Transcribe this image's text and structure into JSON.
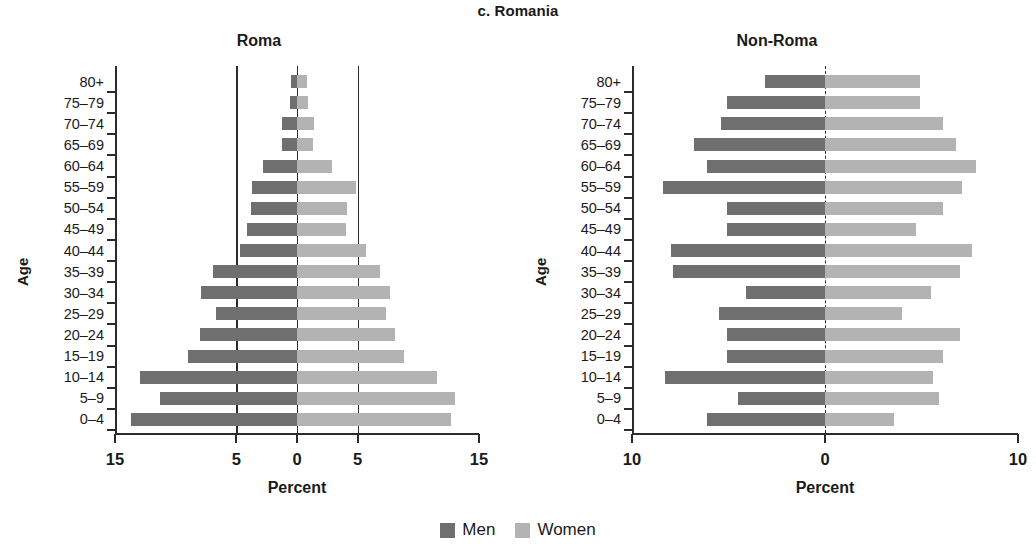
{
  "figure": {
    "title": "c. Romania",
    "legend": [
      {
        "label": "Men",
        "color": "#6f6f6f",
        "key": "men"
      },
      {
        "label": "Women",
        "color": "#b3b3b3",
        "key": "women"
      }
    ]
  },
  "panels": [
    {
      "id": "roma",
      "title": "Roma",
      "xlabel": "Percent",
      "ylabel": "Age"
    },
    {
      "id": "non-roma",
      "title": "Non-Roma",
      "xlabel": "Percent",
      "ylabel": "Age"
    }
  ],
  "chart_data": [
    {
      "type": "bar",
      "subtype": "population-pyramid",
      "title": "Roma",
      "figure_title": "c. Romania",
      "xlabel": "Percent",
      "ylabel": "Age",
      "xlim": [
        -15,
        15
      ],
      "xticks": [
        -15,
        -5,
        0,
        5,
        15
      ],
      "xticklabels": [
        "15",
        "5",
        "0",
        "5",
        "15"
      ],
      "gridlines_vertical": [
        -5,
        0,
        5
      ],
      "grid": false,
      "legend_position": "bottom-center",
      "categories": [
        "80+",
        "75–79",
        "70–74",
        "65–69",
        "60–64",
        "55–59",
        "50–54",
        "45–49",
        "40–44",
        "35–39",
        "30–34",
        "25–29",
        "20–24",
        "15–19",
        "10–14",
        "5–9",
        "0–4"
      ],
      "series": [
        {
          "name": "Men",
          "color": "#6f6f6f",
          "values": [
            0.5,
            0.6,
            1.2,
            1.2,
            2.8,
            3.7,
            3.8,
            4.1,
            4.7,
            6.9,
            7.9,
            6.7,
            8.0,
            9.0,
            12.9,
            11.3,
            13.7
          ]
        },
        {
          "name": "Women",
          "color": "#b3b3b3",
          "values": [
            0.8,
            0.9,
            1.4,
            1.3,
            2.9,
            4.9,
            4.1,
            4.0,
            5.7,
            6.8,
            7.7,
            7.3,
            8.1,
            8.8,
            11.5,
            13.0,
            12.7
          ]
        }
      ]
    },
    {
      "type": "bar",
      "subtype": "population-pyramid",
      "title": "Non-Roma",
      "figure_title": "c. Romania",
      "xlabel": "Percent",
      "ylabel": "Age",
      "xlim": [
        -10,
        10
      ],
      "xticks": [
        -10,
        0,
        10
      ],
      "xticklabels": [
        "10",
        "0",
        "10"
      ],
      "gridlines_vertical": [
        0
      ],
      "grid": false,
      "legend_position": "bottom-center",
      "categories": [
        "80+",
        "75–79",
        "70–74",
        "65–69",
        "60–64",
        "55–59",
        "50–54",
        "45–49",
        "40–44",
        "35–39",
        "30–34",
        "25–29",
        "20–24",
        "15–19",
        "10–14",
        "5–9",
        "0–4"
      ],
      "series": [
        {
          "name": "Men",
          "color": "#6f6f6f",
          "values": [
            3.1,
            5.1,
            5.4,
            6.8,
            6.1,
            8.4,
            5.1,
            5.1,
            8.0,
            7.9,
            4.1,
            5.5,
            5.1,
            5.1,
            8.3,
            4.5,
            6.1
          ]
        },
        {
          "name": "Women",
          "color": "#b3b3b3",
          "values": [
            4.9,
            4.9,
            6.1,
            6.8,
            7.8,
            7.1,
            6.1,
            4.7,
            7.6,
            7.0,
            5.5,
            4.0,
            7.0,
            6.1,
            5.6,
            5.9,
            3.6
          ]
        }
      ]
    }
  ]
}
